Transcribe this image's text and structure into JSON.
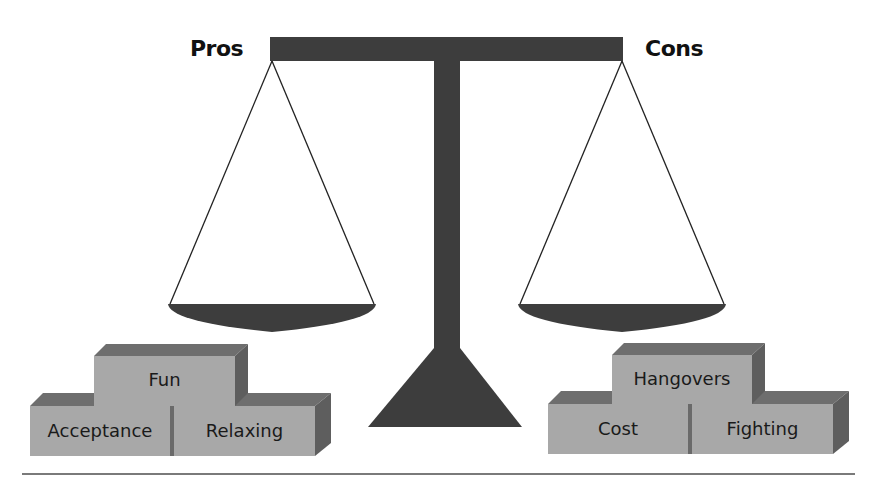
{
  "diagram": {
    "type": "balance-scale",
    "labels": {
      "left": "Pros",
      "right": "Cons"
    },
    "left_blocks": [
      {
        "label": "Fun",
        "row": "top"
      },
      {
        "label": "Acceptance",
        "row": "bottom"
      },
      {
        "label": "Relaxing",
        "row": "bottom"
      }
    ],
    "right_blocks": [
      {
        "label": "Hangovers",
        "row": "top"
      },
      {
        "label": "Cost",
        "row": "bottom"
      },
      {
        "label": "Fighting",
        "row": "bottom"
      }
    ],
    "colors": {
      "scale": "#3d3d3d",
      "block_front": "#a8a8a8",
      "block_top": "#6e6e6e",
      "block_side": "#5e5e5e",
      "string": "#222222",
      "rule": "#7a7a7a"
    }
  }
}
